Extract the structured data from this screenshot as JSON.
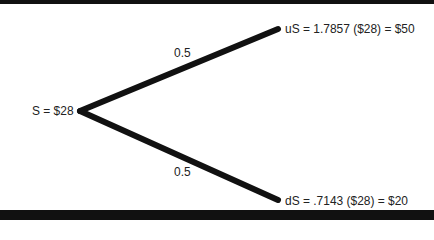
{
  "tree": {
    "root": {
      "label": "S = $28"
    },
    "up": {
      "label": "uS = 1.7857 ($28) = $50",
      "probability": "0.5"
    },
    "down": {
      "label": "dS = .7143 ($28) = $20",
      "probability": "0.5"
    }
  },
  "colors": {
    "line": "#111111",
    "text": "#222222",
    "background": "#ffffff"
  }
}
